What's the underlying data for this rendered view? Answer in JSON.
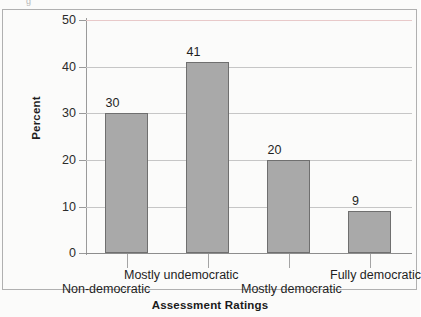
{
  "figure": {
    "top_bleed_glyph": "g",
    "frame_color": "#b0b0b0",
    "bar_fill": "#a9a9a9",
    "bar_stroke": "#6f6f6f",
    "grid_color": "#c6c6c6",
    "top_gridline_color": "#e8c9c9"
  },
  "chart_data": {
    "type": "bar",
    "title": "",
    "xlabel": "Assessment Ratings",
    "ylabel": "Percent",
    "categories": [
      "Non-democratic",
      "Mostly undemocratic",
      "Mostly democratic",
      "Fully democratic"
    ],
    "values": [
      30,
      41,
      20,
      9
    ],
    "value_labels": [
      "30",
      "41",
      "20",
      "9"
    ],
    "ylim": [
      0,
      50
    ],
    "yticks": [
      0,
      10,
      20,
      30,
      40,
      50
    ],
    "ytick_labels": [
      "0",
      "10",
      "20",
      "30",
      "40",
      "50"
    ],
    "grid": "horizontal",
    "legend": "none",
    "label_stagger": [
      "low",
      "high",
      "low",
      "high"
    ]
  }
}
